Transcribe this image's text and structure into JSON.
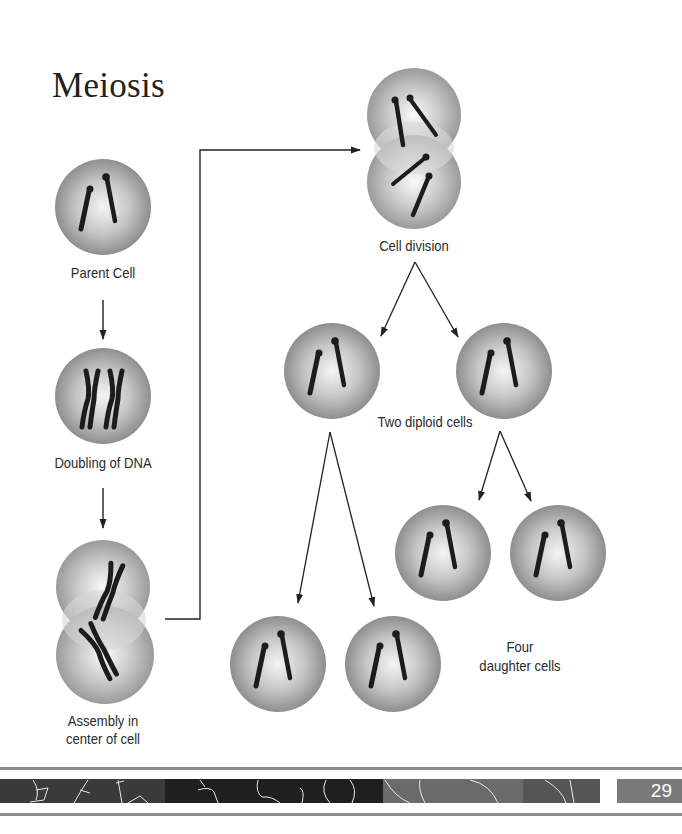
{
  "title": "Meiosis",
  "labels": {
    "parent_cell": "Parent Cell",
    "doubling": "Doubling of DNA",
    "assembly_line1": "Assembly in",
    "assembly_line2": "center of cell",
    "cell_division": "Cell division",
    "two_diploid": "Two diploid cells",
    "four_line1": "Four",
    "four_line2": "daughter cells"
  },
  "stages": [
    {
      "id": "parent-cell",
      "label": "Parent Cell",
      "chromosomes": "2 single"
    },
    {
      "id": "doubling-of-dna",
      "label": "Doubling of DNA",
      "chromosomes": "2 duplicated"
    },
    {
      "id": "assembly",
      "label": "Assembly in center of cell",
      "chromosomes": "2 duplicated, dividing cell"
    },
    {
      "id": "cell-division",
      "label": "Cell division",
      "chromosomes": "4 single, dividing cell"
    },
    {
      "id": "two-diploid-cells",
      "label": "Two diploid cells",
      "count": 2
    },
    {
      "id": "four-daughter-cells",
      "label": "Four daughter cells",
      "count": 4
    }
  ],
  "colors": {
    "cell_center": "#f2f2f2",
    "cell_edge": "#8e8e8e",
    "chromosome": "#1c1c1c",
    "arrow": "#222222",
    "footer_box": "#7a7a7a"
  },
  "footer": {
    "page_number": "29"
  }
}
